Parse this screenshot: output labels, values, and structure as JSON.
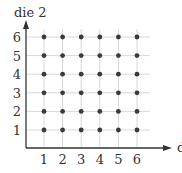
{
  "chart_data": {
    "type": "scatter",
    "title": "",
    "xlabel": "die 1",
    "ylabel": "die 2",
    "x_ticks": [
      "1",
      "2",
      "3",
      "4",
      "5",
      "6"
    ],
    "y_ticks": [
      "1",
      "2",
      "3",
      "4",
      "5",
      "6"
    ],
    "xlim": [
      0,
      6.5
    ],
    "ylim": [
      0,
      6.5
    ],
    "grid": true,
    "legend": null,
    "points": [
      [
        1,
        1
      ],
      [
        2,
        1
      ],
      [
        3,
        1
      ],
      [
        4,
        1
      ],
      [
        5,
        1
      ],
      [
        6,
        1
      ],
      [
        1,
        2
      ],
      [
        2,
        2
      ],
      [
        3,
        2
      ],
      [
        4,
        2
      ],
      [
        5,
        2
      ],
      [
        6,
        2
      ],
      [
        1,
        3
      ],
      [
        2,
        3
      ],
      [
        3,
        3
      ],
      [
        4,
        3
      ],
      [
        5,
        3
      ],
      [
        6,
        3
      ],
      [
        1,
        4
      ],
      [
        2,
        4
      ],
      [
        3,
        4
      ],
      [
        4,
        4
      ],
      [
        5,
        4
      ],
      [
        6,
        4
      ],
      [
        1,
        5
      ],
      [
        2,
        5
      ],
      [
        3,
        5
      ],
      [
        4,
        5
      ],
      [
        5,
        5
      ],
      [
        6,
        5
      ],
      [
        1,
        6
      ],
      [
        2,
        6
      ],
      [
        3,
        6
      ],
      [
        4,
        6
      ],
      [
        5,
        6
      ],
      [
        6,
        6
      ]
    ]
  },
  "colors": {
    "axis": "#333333",
    "grid": "#d8d8d8",
    "point": "#3a3a3a"
  }
}
